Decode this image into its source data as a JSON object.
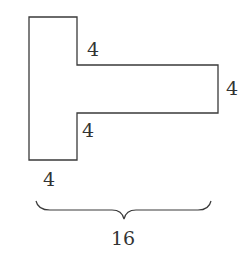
{
  "diagram": {
    "shape": "T-shaped polygon rotated (vertical stem on left, horizontal arm extending right)",
    "labels": {
      "top_notch": "4",
      "right_edge": "4",
      "bottom_notch": "4",
      "stem_bottom": "4",
      "total_width": "16"
    },
    "colors": {
      "stroke": "#3a3a3a",
      "text": "#333333",
      "background": "#ffffff"
    }
  }
}
